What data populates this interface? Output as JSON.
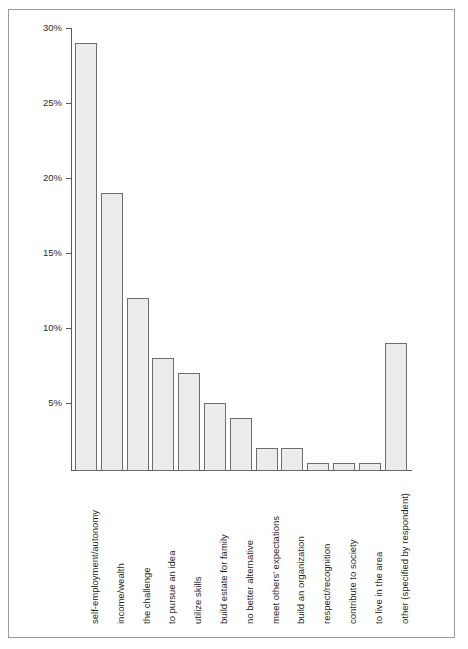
{
  "chart_data": {
    "type": "bar",
    "title": "",
    "subtitle": "",
    "xlabel": "",
    "ylabel": "",
    "grid": false,
    "legend": null,
    "orientation": "vertical",
    "bar_fill_color": "#ececec",
    "bar_border_color": "#6e6e6e",
    "axis_color": "#5a5a5a",
    "frame_color": "#9a9a9a",
    "background_color": "#ffffff",
    "value_unit": "%",
    "ylim": [
      0,
      30
    ],
    "yticks": [
      5,
      10,
      15,
      20,
      25,
      30
    ],
    "ytick_labels": [
      "5%",
      "10%",
      "15%",
      "20%",
      "25%",
      "30%"
    ],
    "categories": [
      "self-employment/autonomy",
      "income/wealth",
      "the challenge",
      "to pursue an idea",
      "utilize skills",
      "build estate for family",
      "no better alternative",
      "meet others' expectations",
      "build an organization",
      "respect/recognition",
      "contribute to society",
      "to live in the area",
      "other (specified by respondent)"
    ],
    "values": [
      29,
      19,
      12,
      8,
      7,
      5,
      4,
      2,
      2,
      1,
      1,
      1,
      9
    ]
  }
}
